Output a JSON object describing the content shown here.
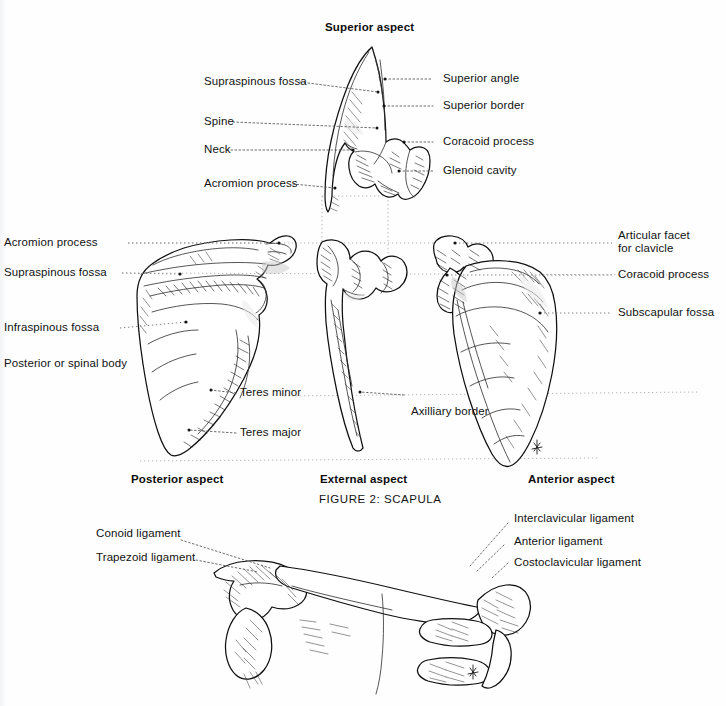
{
  "figure": {
    "caption": "FIGURE 2: SCAPULA"
  },
  "superior_view": {
    "heading": "Superior aspect",
    "labels_left": [
      {
        "text": "Supraspinous fossa"
      },
      {
        "text": "Spine"
      },
      {
        "text": "Neck"
      },
      {
        "text": "Acromion process"
      }
    ],
    "labels_right": [
      {
        "text": "Superior angle"
      },
      {
        "text": "Superior border"
      },
      {
        "text": "Coracoid process"
      },
      {
        "text": "Glenoid cavity"
      }
    ]
  },
  "posterior_view": {
    "heading": "Posterior aspect",
    "labels_left": [
      {
        "text": "Acromion process"
      },
      {
        "text": "Supraspinous fossa"
      },
      {
        "text": "Infraspinous fossa"
      },
      {
        "text": "Posterior or spinal body"
      }
    ],
    "labels_inner": [
      {
        "text": "Teres minor"
      },
      {
        "text": "Teres major"
      }
    ]
  },
  "external_view": {
    "heading": "External aspect",
    "labels": [
      {
        "text": "Axilliary border"
      }
    ]
  },
  "anterior_view": {
    "heading": "Anterior aspect",
    "labels_right": [
      {
        "text": "Articular facet for clavicle",
        "line1": "Articular facet",
        "line2": "for clavicle"
      },
      {
        "text": "Coracoid process"
      },
      {
        "text": "Subscapular fossa"
      }
    ]
  },
  "clavicle_view": {
    "labels_left": [
      {
        "text": "Conoid ligament"
      },
      {
        "text": "Trapezoid ligament"
      }
    ],
    "labels_right": [
      {
        "text": "Interclavicular ligament"
      },
      {
        "text": "Anterior ligament"
      },
      {
        "text": "Costoclavicular ligament"
      }
    ]
  },
  "colors": {
    "page_background": "#fefefe",
    "ink": "#111111",
    "leader_line": "#5a5a5a",
    "bone_outline": "#0f0f0f",
    "shading": "#c9c9c9"
  }
}
